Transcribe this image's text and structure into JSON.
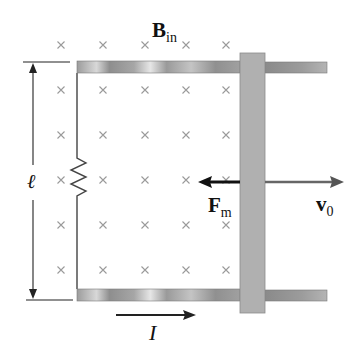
{
  "diagram": {
    "type": "physics-circuit",
    "labels": {
      "field_symbol": "B",
      "field_subscript": "in",
      "length_symbol": "ℓ",
      "force_symbol": "F",
      "force_subscript": "m",
      "velocity_symbol": "v",
      "velocity_subscript": "0",
      "current_symbol": "I"
    },
    "field_marker": "×",
    "field_marker_color": "#9a9a9a",
    "field_grid": {
      "columns_x": [
        61,
        103,
        145,
        186,
        226
      ],
      "rows_y": [
        45,
        90,
        135,
        180,
        225,
        270
      ]
    },
    "colors": {
      "rail": "#a8a8a8",
      "bar": "#b0b0b0",
      "wire": "#444444",
      "force_arrow": "#111111",
      "velocity_arrow": "#666666"
    }
  }
}
